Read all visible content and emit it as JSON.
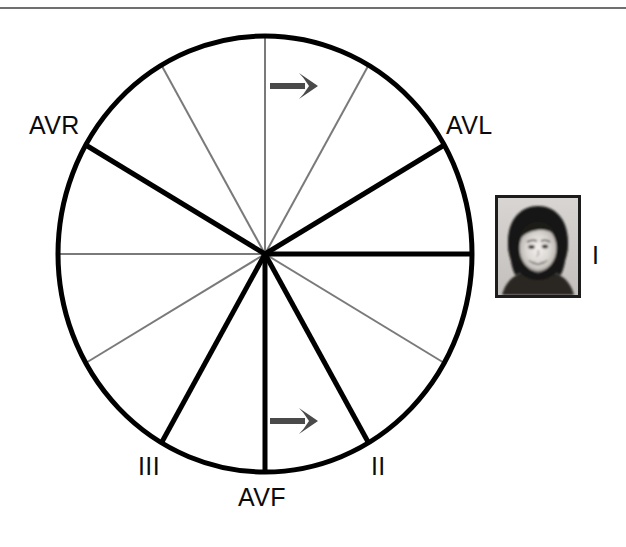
{
  "figure": {
    "name": "hexaxial-reference-system",
    "background_color": "#ffffff"
  },
  "top_rule": {
    "color": "#6f6f6f",
    "thickness_px": 2
  },
  "circle": {
    "center_x": 265,
    "center_y": 254,
    "radius_x": 207,
    "radius_y": 218,
    "stroke_color": "#000000",
    "stroke_width": 5
  },
  "colors": {
    "lead_axis": "#000000",
    "minor_axis": "#7a7a7a",
    "arrow": "#4a4a4a",
    "label_text": "#0b0b0b",
    "photo_border": "#1c1c1c"
  },
  "labels": {
    "avr": "AVR",
    "avl": "AVL",
    "lead_iii": "III",
    "avf": "AVF",
    "lead_ii": "II",
    "lead_i": "I"
  },
  "chart_data": {
    "type": "scatter",
    "xlabel": "",
    "ylabel": "",
    "coordinate_system": "polar-degrees-ecg",
    "center": [
      265,
      254
    ],
    "radius": [
      207,
      218
    ],
    "axes": [
      {
        "label": "I",
        "degrees": 0,
        "style": "lead",
        "stroke": "#000000",
        "width": 5,
        "label_shown": true
      },
      {
        "label": "",
        "degrees": 30,
        "style": "minor",
        "stroke": "#7a7a7a",
        "width": 2,
        "label_shown": false
      },
      {
        "label": "II",
        "degrees": 60,
        "style": "lead",
        "stroke": "#000000",
        "width": 5,
        "label_shown": true
      },
      {
        "label": "AVF",
        "degrees": 90,
        "style": "lead",
        "stroke": "#000000",
        "width": 5,
        "label_shown": true
      },
      {
        "label": "III",
        "degrees": 120,
        "style": "lead",
        "stroke": "#000000",
        "width": 5,
        "label_shown": true
      },
      {
        "label": "",
        "degrees": 150,
        "style": "minor",
        "stroke": "#7a7a7a",
        "width": 2,
        "label_shown": false
      },
      {
        "label": "",
        "degrees": 180,
        "style": "minor",
        "stroke": "#7a7a7a",
        "width": 2,
        "label_shown": false
      },
      {
        "label": "AVR",
        "degrees": -150,
        "style": "lead",
        "stroke": "#000000",
        "width": 5,
        "label_shown": true
      },
      {
        "label": "",
        "degrees": -120,
        "style": "minor",
        "stroke": "#7a7a7a",
        "width": 2,
        "label_shown": false
      },
      {
        "label": "",
        "degrees": -90,
        "style": "minor",
        "stroke": "#7a7a7a",
        "width": 2,
        "label_shown": false
      },
      {
        "label": "",
        "degrees": -60,
        "style": "minor",
        "stroke": "#7a7a7a",
        "width": 2,
        "label_shown": false
      },
      {
        "label": "AVL",
        "degrees": -30,
        "style": "lead",
        "stroke": "#000000",
        "width": 5,
        "label_shown": true
      }
    ],
    "annotations": [
      {
        "type": "arrow",
        "name": "upper-direction-arrow",
        "direction": "right",
        "x1": 270,
        "y1": 86,
        "x2": 318,
        "y2": 86,
        "color": "#4a4a4a"
      },
      {
        "type": "arrow",
        "name": "lower-direction-arrow",
        "direction": "right",
        "x1": 270,
        "y1": 421,
        "x2": 318,
        "y2": 421,
        "color": "#4a4a4a"
      }
    ],
    "label_positions": [
      {
        "text": "AVR",
        "x": 29,
        "y": 113
      },
      {
        "text": "AVL",
        "x": 446,
        "y": 113
      },
      {
        "text": "III",
        "x": 138,
        "y": 454
      },
      {
        "text": "AVF",
        "x": 238,
        "y": 485
      },
      {
        "text": "II",
        "x": 371,
        "y": 454
      },
      {
        "text": "I",
        "x": 592,
        "y": 243
      }
    ]
  },
  "photo": {
    "alt": "grayscale portrait photograph of a smiling woman",
    "x": 495,
    "y": 195,
    "width": 86,
    "height": 103,
    "border_color": "#1c1c1c"
  }
}
